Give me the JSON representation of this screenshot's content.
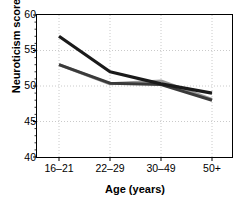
{
  "chart_data": {
    "type": "line",
    "title": "",
    "xlabel": "Age (years)",
    "ylabel": "Neuroticism score",
    "categories": [
      "16–21",
      "22–29",
      "30–49",
      "50+"
    ],
    "ylim": [
      40,
      60
    ],
    "yticks": [
      40,
      45,
      50,
      55,
      60
    ],
    "yticklabels": [
      "40",
      "45",
      "50",
      "55",
      "60"
    ],
    "yminorticks": [
      41,
      42,
      43,
      44,
      46,
      47,
      48,
      49,
      51,
      52,
      53,
      54,
      56,
      57,
      58,
      59
    ],
    "grid": true,
    "grid_style": "dotted",
    "legend": "none",
    "series": [
      {
        "name": "series-1",
        "color": "#1a1a1a",
        "linewidth": 3.2,
        "values": [
          57.0,
          52.0,
          50.3,
          49.0
        ]
      },
      {
        "name": "series-2",
        "color": "#3a3a3a",
        "linewidth": 3.0,
        "values": [
          53.0,
          50.4,
          50.2,
          48.0
        ]
      },
      {
        "name": "series-3",
        "color": "#9a9a9a",
        "linewidth": 3.0,
        "values": [
          53.0,
          50.3,
          50.7,
          48.1
        ]
      }
    ]
  },
  "axes": {
    "frame_color": "#000000",
    "grid_color": "#bdbdbd",
    "background": "#ffffff"
  }
}
